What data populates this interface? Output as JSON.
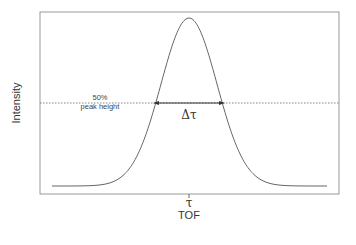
{
  "diagram": {
    "title": "",
    "y_axis_label": "Intensity",
    "x_axis_label": "TOF",
    "x_tick_label": "τ",
    "half_max_label_line1": "50%",
    "half_max_label_line2": "peak height",
    "width_label": "Δτ",
    "curve_color": "#666666",
    "frame_color": "#888888"
  },
  "chart_data": {
    "type": "line",
    "title": "",
    "xlabel": "TOF",
    "ylabel": "Intensity",
    "x_ticks": [
      "τ"
    ],
    "annotations": [
      "50% peak height",
      "Δτ"
    ],
    "grid": false
  }
}
